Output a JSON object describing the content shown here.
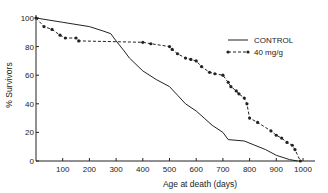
{
  "chart_data": {
    "type": "line",
    "title": "",
    "xlabel": "Age at death (days)",
    "ylabel": "% Survivors",
    "xlim": [
      0,
      1050
    ],
    "ylim": [
      0,
      100
    ],
    "x_ticks": [
      100,
      200,
      300,
      400,
      500,
      600,
      700,
      800,
      900,
      1000
    ],
    "y_ticks": [
      0,
      20,
      40,
      60,
      80,
      100
    ],
    "grid": false,
    "legend_position": "upper right",
    "series": [
      {
        "name": "CONTROL",
        "style": "solid",
        "markers": false,
        "x": [
          0,
          100,
          200,
          250,
          280,
          300,
          330,
          350,
          400,
          450,
          500,
          530,
          560,
          600,
          630,
          660,
          700,
          720,
          780,
          820,
          860,
          900,
          950,
          980
        ],
        "y": [
          100,
          97,
          94,
          91,
          89,
          84,
          77,
          72,
          63,
          57,
          52,
          46,
          40,
          35,
          30,
          25,
          20,
          15,
          14,
          11,
          8,
          4,
          1,
          0
        ]
      },
      {
        "name": "40 mg/g",
        "style": "dashed",
        "markers": true,
        "x": [
          0,
          30,
          60,
          90,
          110,
          150,
          160,
          400,
          430,
          500,
          510,
          530,
          560,
          580,
          600,
          620,
          650,
          670,
          700,
          720,
          730,
          750,
          760,
          780,
          790,
          800,
          830,
          880,
          900,
          920,
          940,
          960,
          970,
          990
        ],
        "y": [
          100,
          94,
          92,
          88,
          86,
          86,
          84,
          83,
          82,
          80,
          78,
          75,
          72,
          71,
          70,
          66,
          62,
          61,
          60,
          55,
          52,
          49,
          47,
          44,
          40,
          30,
          27,
          21,
          18,
          16,
          13,
          11,
          8,
          0
        ]
      }
    ]
  }
}
